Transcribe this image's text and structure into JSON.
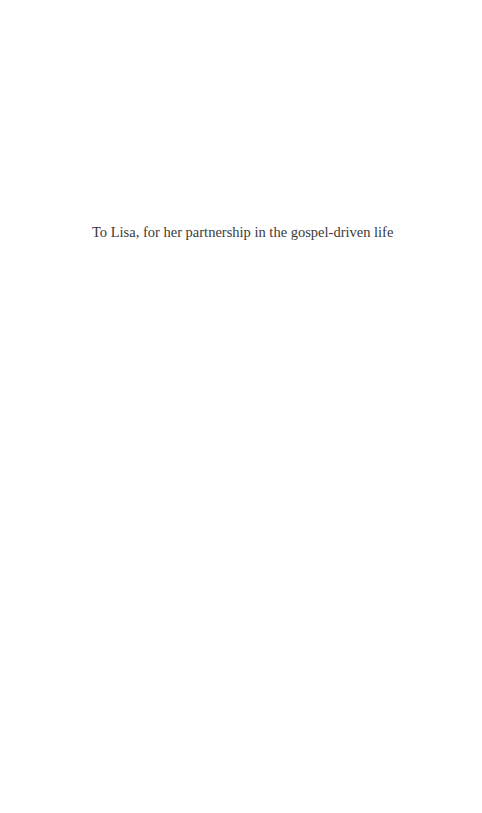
{
  "page": {
    "dedication": "To Lisa, for her partnership in the gospel-driven life"
  }
}
